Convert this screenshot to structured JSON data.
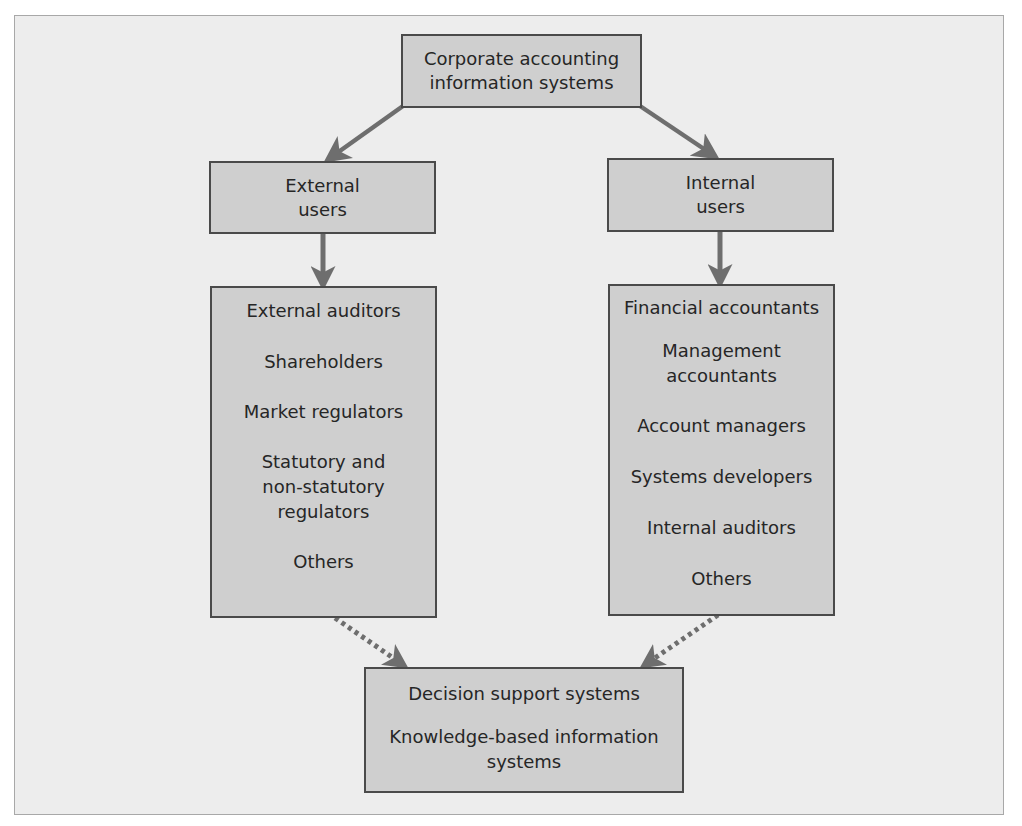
{
  "diagram": {
    "colors": {
      "background": "#ffffff",
      "frame_fill": "#ededed",
      "frame_border": "#a8a8a8",
      "box_fill": "#cfcfcf",
      "box_border": "#4a4a4a",
      "arrow": "#6e6e6e",
      "text": "#262626"
    },
    "root": {
      "line1": "Corporate accounting",
      "line2": "information systems"
    },
    "external": {
      "header": {
        "line1": "External",
        "line2": "users"
      },
      "items": [
        "External auditors",
        "Shareholders",
        "Market regulators",
        "Statutory and\nnon-statutory\nregulators",
        "Others"
      ]
    },
    "internal": {
      "header": {
        "line1": "Internal",
        "line2": "users"
      },
      "items": [
        "Financial accountants",
        "Management\naccountants",
        "Account managers",
        "Systems developers",
        "Internal auditors",
        "Others"
      ]
    },
    "outcome": {
      "items": [
        "Decision support systems",
        "Knowledge-based information\nsystems"
      ]
    },
    "connections": [
      {
        "from": "root",
        "to": "external-header",
        "style": "solid"
      },
      {
        "from": "root",
        "to": "internal-header",
        "style": "solid"
      },
      {
        "from": "external-header",
        "to": "external-list",
        "style": "solid"
      },
      {
        "from": "internal-header",
        "to": "internal-list",
        "style": "solid"
      },
      {
        "from": "external-list",
        "to": "outcome",
        "style": "dotted"
      },
      {
        "from": "internal-list",
        "to": "outcome",
        "style": "dotted"
      }
    ]
  }
}
